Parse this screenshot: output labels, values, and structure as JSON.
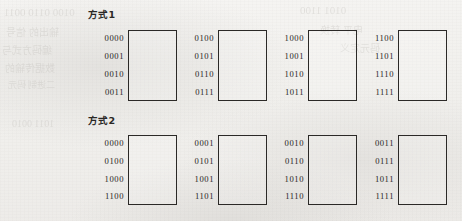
{
  "page": {
    "background_color": "#f1f0ed",
    "ink_color": "#1f1d1c",
    "box_border_color": "#2b2927"
  },
  "bleed_through_text": [
    "0100 0110 0011",
    "输出的 信号",
    "编码方式与",
    "数据传输的",
    "二进制 码元",
    "0101 1100",
    "电平 转换",
    "码元定义",
    "1011 0010"
  ],
  "sections": [
    {
      "title": "方式1",
      "title_x": 88,
      "title_y": 7,
      "row_y": 30,
      "box_height": 71,
      "groups": [
        {
          "x": 104,
          "label_width": 24,
          "box_width": 49,
          "codes": [
            "0000",
            "0001",
            "0010",
            "0011"
          ]
        },
        {
          "x": 194,
          "label_width": 24,
          "box_width": 49,
          "codes": [
            "0100",
            "0101",
            "0110",
            "0111"
          ]
        },
        {
          "x": 284,
          "label_width": 24,
          "box_width": 49,
          "codes": [
            "1000",
            "1001",
            "1010",
            "1011"
          ]
        },
        {
          "x": 374,
          "label_width": 24,
          "box_width": 49,
          "codes": [
            "1100",
            "1101",
            "1110",
            "1111"
          ]
        }
      ]
    },
    {
      "title": "方式2",
      "title_x": 88,
      "title_y": 113,
      "row_y": 135,
      "box_height": 70,
      "groups": [
        {
          "x": 104,
          "label_width": 24,
          "box_width": 49,
          "codes": [
            "0000",
            "0100",
            "1000",
            "1100"
          ]
        },
        {
          "x": 194,
          "label_width": 24,
          "box_width": 49,
          "codes": [
            "0001",
            "0101",
            "1001",
            "1101"
          ]
        },
        {
          "x": 284,
          "label_width": 24,
          "box_width": 49,
          "codes": [
            "0010",
            "0110",
            "1010",
            "1110"
          ]
        },
        {
          "x": 374,
          "label_width": 24,
          "box_width": 49,
          "codes": [
            "0011",
            "0111",
            "1011",
            "1111"
          ]
        }
      ]
    }
  ]
}
